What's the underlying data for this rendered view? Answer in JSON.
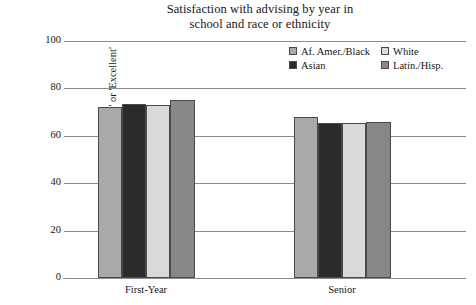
{
  "chart_data": {
    "type": "bar",
    "title": "Satisfaction with advising by year in school and race or ethnicity",
    "title_lines": [
      "Satisfaction with advising by year in",
      "school and race or ethnicity"
    ],
    "xlabel": "",
    "ylabel": "Percent 'Good' or 'Excellent'",
    "categories": [
      "First-Year",
      "Senior"
    ],
    "ylim": [
      0,
      100
    ],
    "yticks": [
      0,
      20,
      40,
      60,
      80,
      100
    ],
    "ytick_labels": [
      "0",
      "20",
      "40",
      "60",
      "80",
      "100"
    ],
    "grid": true,
    "legend_position": "top-right",
    "series": [
      {
        "name": "Af. Amer./Black",
        "color": "#a9a9a9",
        "values": [
          72,
          68
        ]
      },
      {
        "name": "Asian",
        "color": "#2b2b2b",
        "values": [
          73.5,
          65.5
        ]
      },
      {
        "name": "White",
        "color": "#d9d9d9",
        "values": [
          73,
          65.5
        ]
      },
      {
        "name": "Latin./Hisp.",
        "color": "#878787",
        "values": [
          75,
          66
        ]
      }
    ]
  },
  "legend": {
    "entries": [
      {
        "label": "Af. Amer./Black",
        "color": "#a9a9a9"
      },
      {
        "label": "White",
        "color": "#d9d9d9"
      },
      {
        "label": "Asian",
        "color": "#2b2b2b"
      },
      {
        "label": "Latin./Hisp.",
        "color": "#878787"
      }
    ]
  },
  "axes": {
    "y_label": "Percent 'Good' or 'Excellent'",
    "y_tick_100": "100",
    "y_tick_80": "80",
    "y_tick_60": "60",
    "y_tick_40": "40",
    "y_tick_20": "20",
    "y_tick_0": "0",
    "x_cat_0": "First-Year",
    "x_cat_1": "Senior"
  },
  "colors": {
    "axis": "#8d8d8d",
    "text": "#161616",
    "bar_border": "#4a4a4a",
    "background": "#ffffff"
  }
}
